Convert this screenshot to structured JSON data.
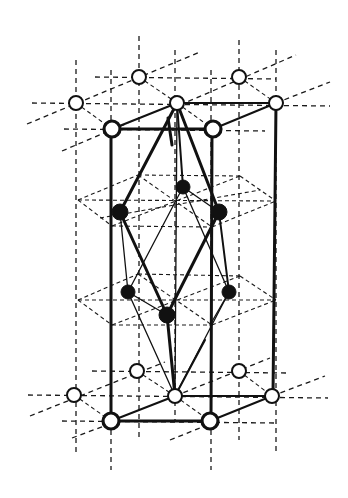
{
  "figure": {
    "colors": {
      "line": "#111111",
      "background": "#ffffff",
      "open_atom_fill": "#ffffff",
      "filled_atom_fill": "#111111"
    },
    "open_atoms_top": [
      {
        "id": "t-left",
        "x": 76,
        "y": 103,
        "r": 7
      },
      {
        "id": "t-back1",
        "x": 139,
        "y": 77,
        "r": 7
      },
      {
        "id": "t-back2",
        "x": 239,
        "y": 77,
        "r": 7
      },
      {
        "id": "t-center",
        "x": 177,
        "y": 103,
        "r": 7
      },
      {
        "id": "t-back-right",
        "x": 276,
        "y": 103,
        "r": 7
      }
    ],
    "open_atoms_top_bold": [
      {
        "id": "t-front-left",
        "x": 112,
        "y": 129,
        "r": 8
      },
      {
        "id": "t-front-right",
        "x": 213,
        "y": 129,
        "r": 8
      }
    ],
    "open_atoms_bottom": [
      {
        "id": "b-left",
        "x": 74,
        "y": 395,
        "r": 7
      },
      {
        "id": "b-back1",
        "x": 137,
        "y": 371,
        "r": 7
      },
      {
        "id": "b-back2",
        "x": 239,
        "y": 371,
        "r": 7
      },
      {
        "id": "b-center",
        "x": 175,
        "y": 396,
        "r": 7
      },
      {
        "id": "b-back-right",
        "x": 272,
        "y": 396,
        "r": 7
      }
    ],
    "open_atoms_bottom_bold": [
      {
        "id": "b-front-left",
        "x": 111,
        "y": 421,
        "r": 8
      },
      {
        "id": "b-front-right",
        "x": 210,
        "y": 421,
        "r": 8
      }
    ],
    "filled_atoms": [
      {
        "id": "f-upper-center",
        "x": 183,
        "y": 187,
        "r": 7
      },
      {
        "id": "f-upper-left",
        "x": 120,
        "y": 212,
        "r": 8
      },
      {
        "id": "f-upper-right",
        "x": 219,
        "y": 212,
        "r": 8
      },
      {
        "id": "f-lower-left",
        "x": 128,
        "y": 292,
        "r": 7
      },
      {
        "id": "f-lower-right",
        "x": 229,
        "y": 292,
        "r": 7
      },
      {
        "id": "f-lower-center",
        "x": 167,
        "y": 315,
        "r": 8
      }
    ]
  }
}
